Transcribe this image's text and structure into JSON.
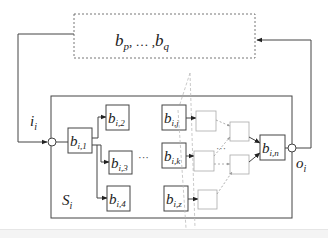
{
  "diagram": {
    "external_block": {
      "label_main": "b",
      "sub_p": "p",
      "sep": ", … ,",
      "label_end": "b",
      "sub_q": "q"
    },
    "system": {
      "label": "S",
      "sub": "i"
    },
    "input": {
      "label": "i",
      "sub": "i"
    },
    "output": {
      "label": "o",
      "sub": "i"
    },
    "blocks": [
      {
        "id": "b_i1",
        "base": "b",
        "sub": "i,1"
      },
      {
        "id": "b_i2",
        "base": "b",
        "sub": "i,2"
      },
      {
        "id": "b_i3",
        "base": "b",
        "sub": "i,3"
      },
      {
        "id": "b_i4",
        "base": "b",
        "sub": "i,4"
      },
      {
        "id": "b_ij",
        "base": "b",
        "sub": "i,j"
      },
      {
        "id": "b_ik",
        "base": "b",
        "sub": "i,k"
      },
      {
        "id": "b_iz",
        "base": "b",
        "sub": "i,z"
      },
      {
        "id": "b_in",
        "base": "b",
        "sub": "i,n"
      }
    ],
    "ellipsis_mid": "···",
    "ellipsis_right": "···",
    "colors": {
      "line": "#444444",
      "dashed": "#999999",
      "faint": "#bbbbbb",
      "background": "#ffffff"
    }
  }
}
